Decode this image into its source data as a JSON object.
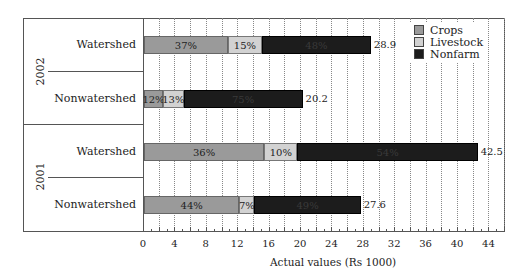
{
  "chart_data": {
    "type": "bar",
    "orientation": "horizontal",
    "stacked": true,
    "title": "",
    "xlabel": "Actual values (Rs 1000)",
    "ylabel": "",
    "xlim": [
      0,
      46
    ],
    "x_ticks": [
      0,
      4,
      8,
      12,
      16,
      20,
      24,
      28,
      32,
      36,
      40,
      44
    ],
    "grid": "vertical dotted every 2 units",
    "legend_position": "top-right inside",
    "legend": [
      "Crops",
      "Livestock",
      "Nonfarm"
    ],
    "colors": {
      "Crops": "#9a9a9a",
      "Livestock": "#d2d2d2",
      "Nonfarm": "#1c1c1c"
    },
    "groups": [
      {
        "year": "2002",
        "bars": [
          {
            "category": "Watershed",
            "total": 28.9,
            "total_label": "28.9",
            "shares": {
              "Crops": 37,
              "Livestock": 15,
              "Nonfarm": 48
            },
            "labels": [
              "37%",
              "15%",
              "48%"
            ]
          },
          {
            "category": "Nonwatershed",
            "total": 20.2,
            "total_label": "20.2",
            "shares": {
              "Crops": 12,
              "Livestock": 13,
              "Nonfarm": 75
            },
            "labels": [
              "12%",
              "13%",
              "75%"
            ]
          }
        ]
      },
      {
        "year": "2001",
        "bars": [
          {
            "category": "Watershed",
            "total": 42.5,
            "total_label": "42.5",
            "shares": {
              "Crops": 36,
              "Livestock": 10,
              "Nonfarm": 54
            },
            "labels": [
              "36%",
              "10%",
              "54%"
            ]
          },
          {
            "category": "Nonwatershed",
            "total": 27.6,
            "total_label": "27.6",
            "shares": {
              "Crops": 44,
              "Livestock": 7,
              "Nonfarm": 49
            },
            "labels": [
              "44%",
              "7%",
              "49%"
            ]
          }
        ]
      }
    ]
  }
}
